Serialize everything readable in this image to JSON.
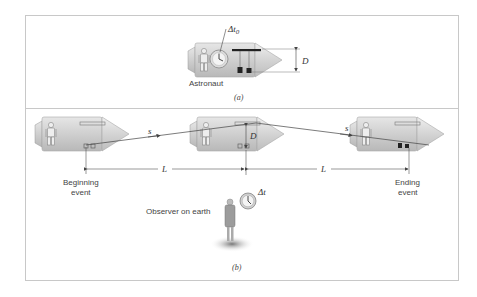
{
  "panel_a": {
    "caption": "(a)",
    "astronaut_label": "Astronaut",
    "clock_label_prefix": "Δt",
    "clock_label_sub": "0",
    "distance_label": "D"
  },
  "panel_b": {
    "caption": "(b)",
    "beginning_label_line1": "Beginning",
    "beginning_label_line2": "event",
    "ending_label_line1": "Ending",
    "ending_label_line2": "event",
    "path_label_1": "s",
    "path_label_2": "s",
    "distance_label_1": "L",
    "distance_label_2": "L",
    "height_label": "D",
    "observer_label": "Observer on earth",
    "observer_clock_label": "Δt"
  },
  "colors": {
    "frame": "#c8c8c8",
    "ship_body": "#d9d9d9",
    "ship_dark": "#9a9a9a",
    "line": "#555555"
  }
}
